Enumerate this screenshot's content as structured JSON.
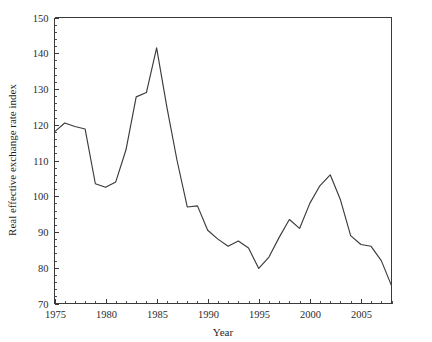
{
  "chart_data": {
    "type": "line",
    "title": "",
    "xlabel": "Year",
    "ylabel": "Real effective exchange rate index",
    "xlim": [
      1975,
      2008
    ],
    "ylim": [
      70,
      150
    ],
    "grid": false,
    "legend": false,
    "legend_position": "none",
    "line_color": "#3b3b3b",
    "axis_color": "#3a3a3a",
    "background_color": "#ffffff",
    "y_ticks": [
      70,
      80,
      90,
      100,
      110,
      120,
      130,
      140,
      150
    ],
    "y_tick_labels": [
      "70",
      "80",
      "90",
      "100",
      "110",
      "120",
      "130",
      "140",
      "150"
    ],
    "y_minor_tick_step": 2,
    "x_ticks": [
      1975,
      1980,
      1985,
      1990,
      1995,
      2000,
      2005
    ],
    "x_tick_labels": [
      "1975",
      "1980",
      "1985",
      "1990",
      "1995",
      "2000",
      "2005"
    ],
    "x_minor_tick_step": 1,
    "series": [
      {
        "name": "Real effective exchange rate index",
        "x": [
          1975,
          1976,
          1977,
          1978,
          1979,
          1980,
          1981,
          1982,
          1983,
          1984,
          1985,
          1986,
          1987,
          1988,
          1989,
          1990,
          1991,
          1992,
          1993,
          1994,
          1995,
          1996,
          1997,
          1998,
          1999,
          2000,
          2001,
          2002,
          2003,
          2004,
          2005,
          2006,
          2007,
          2008
        ],
        "values": [
          118.0,
          120.5,
          119.5,
          118.8,
          103.5,
          102.5,
          104.0,
          113.0,
          127.8,
          129.0,
          141.5,
          125.0,
          110.0,
          97.0,
          97.3,
          90.5,
          88.0,
          86.0,
          87.5,
          85.5,
          79.8,
          83.0,
          88.5,
          93.5,
          91.0,
          98.0,
          103.0,
          106.0,
          99.0,
          89.0,
          86.5,
          86.0,
          82.0,
          75.0
        ]
      }
    ]
  },
  "axes": {
    "x_title": "Year",
    "y_title": "Real effective exchange rate index"
  }
}
